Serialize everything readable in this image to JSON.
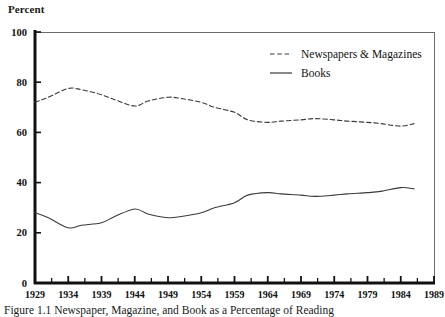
{
  "figure": {
    "caption": "Figure 1.1 Newspaper, Magazine, and Book as a Percentage of Reading",
    "y_axis_title": "Percent"
  },
  "legend": {
    "position": "top-right",
    "entries": [
      {
        "label": "Newspapers & Magazines",
        "style": "dashed",
        "color": "#3a3a3a"
      },
      {
        "label": "Books",
        "style": "solid",
        "color": "#3a3a3a"
      }
    ]
  },
  "chart_data": {
    "type": "line",
    "title": "",
    "subtitle": "",
    "xlabel": "",
    "ylabel": "Percent",
    "xlim": [
      1929,
      1989
    ],
    "ylim": [
      0,
      100
    ],
    "grid": false,
    "legend_position": "top-right",
    "x_tick_labels": [
      "1929",
      "1934",
      "1939",
      "1944",
      "1949",
      "1954",
      "1959",
      "1964",
      "1969",
      "1974",
      "1979",
      "1984",
      "1989"
    ],
    "x_ticks": [
      1929,
      1934,
      1939,
      1944,
      1949,
      1954,
      1959,
      1964,
      1969,
      1974,
      1979,
      1984,
      1989
    ],
    "x_minor_tick_step": 2.5,
    "y_tick_labels": [
      "0",
      "20",
      "40",
      "60",
      "80",
      "100"
    ],
    "y_ticks": [
      0,
      20,
      40,
      60,
      80,
      100
    ],
    "x": [
      1929,
      1931,
      1934,
      1936,
      1939,
      1941,
      1944,
      1946,
      1949,
      1951,
      1954,
      1956,
      1959,
      1961,
      1964,
      1966,
      1969,
      1971,
      1974,
      1976,
      1979,
      1981,
      1984,
      1986
    ],
    "series": [
      {
        "name": "Newspapers & Magazines",
        "style": "dashed",
        "color": "#3a3a3a",
        "values": [
          72,
          74,
          77.5,
          77,
          75,
          73,
          70.5,
          72.5,
          74,
          73.5,
          72,
          70,
          68,
          65,
          64,
          64.5,
          65,
          65.5,
          65,
          64.5,
          64,
          63.5,
          62.5,
          63.5
        ]
      },
      {
        "name": "Books",
        "style": "solid",
        "color": "#3a3a3a",
        "values": [
          28,
          26,
          22,
          23,
          24,
          26.5,
          29.5,
          27.5,
          26,
          26.5,
          28,
          30,
          32,
          35,
          36,
          35.5,
          35,
          34.5,
          35,
          35.5,
          36,
          36.5,
          38,
          37.5
        ]
      }
    ]
  }
}
